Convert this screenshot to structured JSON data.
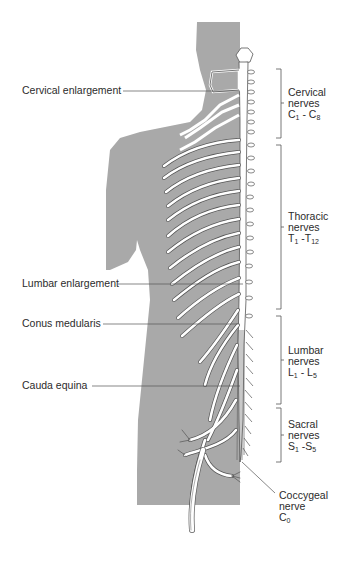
{
  "figure": {
    "colors": {
      "background": "#ffffff",
      "silhouette": "#a9a9a9",
      "nerve_fill": "#ffffff",
      "nerve_outline": "#555555",
      "leader_line": "#555555",
      "text": "#2b2b2b"
    }
  },
  "left_labels": [
    {
      "id": "cervical-enlargement",
      "text": "Cervical enlargement"
    },
    {
      "id": "lumbar-enlargement",
      "text": "Lumbar enlargement"
    },
    {
      "id": "conus-medularis",
      "text": "Conus medularis"
    },
    {
      "id": "cauda-equina",
      "text": "Cauda equina"
    }
  ],
  "right_labels": [
    {
      "id": "cervical-nerves",
      "line1": "Cervical",
      "line2": "nerves",
      "range_start": "C",
      "range_start_sub": "1",
      "range_sep": " - ",
      "range_end": "C",
      "range_end_sub": "8"
    },
    {
      "id": "thoracic-nerves",
      "line1": "Thoracic",
      "line2": "nerves",
      "range_start": "T",
      "range_start_sub": "1",
      "range_sep": " -",
      "range_end": "T",
      "range_end_sub": "12"
    },
    {
      "id": "lumbar-nerves",
      "line1": "Lumbar",
      "line2": "nerves",
      "range_start": "L",
      "range_start_sub": "1",
      "range_sep": " - ",
      "range_end": "L",
      "range_end_sub": "5"
    },
    {
      "id": "sacral-nerves",
      "line1": "Sacral",
      "line2": "nerves",
      "range_start": "S",
      "range_start_sub": "1",
      "range_sep": " -",
      "range_end": "S",
      "range_end_sub": "5"
    },
    {
      "id": "coccygeal-nerve",
      "line1": "Coccygeal",
      "line2": "nerve",
      "range_start": "C",
      "range_start_sub": "0"
    }
  ]
}
